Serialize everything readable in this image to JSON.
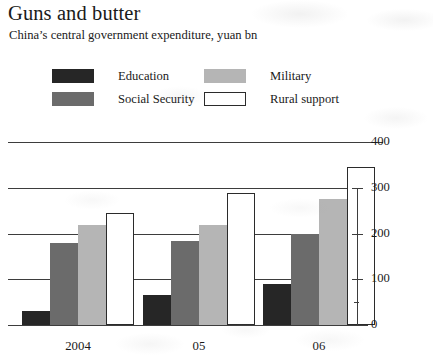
{
  "chart_data": {
    "type": "bar",
    "title": "Guns and butter",
    "subtitle": "China’s central government expenditure, yuan bn",
    "xlabel": "",
    "ylabel": "",
    "ylim": [
      0,
      400
    ],
    "yticks": [
      0,
      100,
      200,
      300,
      400
    ],
    "ytick_labels": [
      "0",
      "100",
      "200",
      "300",
      "400"
    ],
    "grid": "horizontal",
    "legend_position": "top",
    "axis_side": "right",
    "categories": [
      "2004",
      "05",
      "06"
    ],
    "series": [
      {
        "name": "Education",
        "color": "#262626",
        "values": [
          30,
          65,
          90
        ]
      },
      {
        "name": "Social Security",
        "color": "#6b6b6b",
        "values": [
          180,
          185,
          200
        ]
      },
      {
        "name": "Military",
        "color": "#b5b5b5",
        "values": [
          220,
          220,
          275
        ]
      },
      {
        "name": "Rural support",
        "color": "#ffffff",
        "values": [
          245,
          290,
          345
        ]
      }
    ]
  },
  "legend": {
    "items": [
      {
        "label": "Education"
      },
      {
        "label": "Social Security"
      },
      {
        "label": "Military"
      },
      {
        "label": "Rural support"
      }
    ]
  },
  "yaxis": {
    "labels": [
      "400",
      "300",
      "200",
      "100",
      "0"
    ]
  },
  "xaxis": {
    "labels": [
      "2004",
      "05",
      "06"
    ]
  }
}
